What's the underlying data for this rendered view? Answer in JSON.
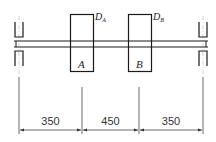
{
  "diagram": {
    "type": "shaft-with-two-disks",
    "disks": [
      {
        "id": "A",
        "label": "A",
        "diameter_label": "D",
        "diameter_subscript": "A"
      },
      {
        "id": "B",
        "label": "B",
        "diameter_label": "D",
        "diameter_subscript": "B"
      }
    ],
    "supports": [
      {
        "id": "left-bearing"
      },
      {
        "id": "right-bearing"
      }
    ],
    "dimensions": [
      {
        "id": "left-span",
        "value": "350"
      },
      {
        "id": "middle-span",
        "value": "450"
      },
      {
        "id": "right-span",
        "value": "350"
      }
    ]
  },
  "colors": {
    "line": "#1a1a1a",
    "centerline": "#bbbbbb",
    "dim_line": "#444444",
    "background": "#ffffff"
  }
}
